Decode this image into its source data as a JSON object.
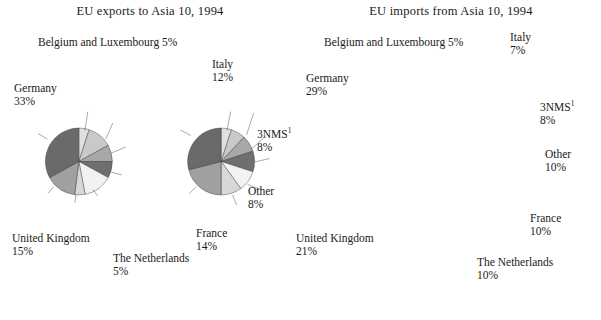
{
  "figure": {
    "title_left": "EU exports to Asia 10, 1994",
    "title_right": "EU imports from Asia 10, 1994",
    "footnote_marker": "1",
    "background": "#ffffff",
    "outline_color": "#2b2b2b"
  },
  "palette": {
    "belgium": "#e0e0e0",
    "italy": "#c9c9c9",
    "nms": "#a8a8a8",
    "other": "#6f6f6f",
    "france": "#f2f2f2",
    "netherlands": "#d8d8d8",
    "uk": "#a0a0a0",
    "germany": "#6a6a6a"
  },
  "chart_data": [
    {
      "type": "pie",
      "id": "eu-exports-asia-10-1994",
      "title": "EU exports to Asia 10, 1994",
      "start_angle_deg": 0,
      "direction": "clockwise",
      "total": 100,
      "unit": "%",
      "categories": [
        "Belgium and Luxembourg",
        "Italy",
        "3NMS",
        "Other",
        "France",
        "The Netherlands",
        "United Kingdom",
        "Germany"
      ],
      "values": [
        5,
        12,
        8,
        8,
        14,
        5,
        15,
        33
      ],
      "labels": [
        {
          "name": "Belgium and Luxembourg",
          "value": 5,
          "text": "Belgium and Luxembourg",
          "pct": "5%",
          "inline": true,
          "superscript": false
        },
        {
          "name": "Italy",
          "value": 12,
          "text": "Italy",
          "pct": "12%",
          "inline": false,
          "superscript": false
        },
        {
          "name": "3NMS",
          "value": 8,
          "text": "3NMS",
          "pct": "8%",
          "inline": false,
          "superscript": true
        },
        {
          "name": "Other",
          "value": 8,
          "text": "Other",
          "pct": "8%",
          "inline": false,
          "superscript": false
        },
        {
          "name": "France",
          "value": 14,
          "text": "France",
          "pct": "14%",
          "inline": false,
          "superscript": false
        },
        {
          "name": "The Netherlands",
          "value": 5,
          "text": "The Netherlands",
          "pct": "5%",
          "inline": false,
          "superscript": false
        },
        {
          "name": "United Kingdom",
          "value": 15,
          "text": "United Kingdom",
          "pct": "15%",
          "inline": false,
          "superscript": false
        },
        {
          "name": "Germany",
          "value": 33,
          "text": "Germany",
          "pct": "33%",
          "inline": false,
          "superscript": false
        }
      ]
    },
    {
      "type": "pie",
      "id": "eu-imports-asia-10-1994",
      "title": "EU imports from Asia 10, 1994",
      "start_angle_deg": 0,
      "direction": "clockwise",
      "total": 100,
      "unit": "%",
      "categories": [
        "Belgium and Luxembourg",
        "Italy",
        "3NMS",
        "Other",
        "France",
        "The Netherlands",
        "United Kingdom",
        "Germany"
      ],
      "values": [
        5,
        7,
        8,
        10,
        10,
        10,
        21,
        29
      ],
      "labels": [
        {
          "name": "Belgium and Luxembourg",
          "value": 5,
          "text": "Belgium and Luxembourg",
          "pct": "5%",
          "inline": true,
          "superscript": false
        },
        {
          "name": "Italy",
          "value": 7,
          "text": "Italy",
          "pct": "7%",
          "inline": false,
          "superscript": false
        },
        {
          "name": "3NMS",
          "value": 8,
          "text": "3NMS",
          "pct": "8%",
          "inline": false,
          "superscript": true
        },
        {
          "name": "Other",
          "value": 10,
          "text": "Other",
          "pct": "10%",
          "inline": false,
          "superscript": false
        },
        {
          "name": "France",
          "value": 10,
          "text": "France",
          "pct": "10%",
          "inline": false,
          "superscript": false
        },
        {
          "name": "The Netherlands",
          "value": 10,
          "text": "The Netherlands",
          "pct": "10%",
          "inline": false,
          "superscript": false
        },
        {
          "name": "United Kingdom",
          "value": 21,
          "text": "United Kingdom",
          "pct": "21%",
          "inline": false,
          "superscript": false
        },
        {
          "name": "Germany",
          "value": 29,
          "text": "Germany",
          "pct": "29%",
          "inline": false,
          "superscript": false
        }
      ]
    }
  ],
  "layout": {
    "left": {
      "cx": 158,
      "cy": 163,
      "r": 67,
      "label_positions": [
        {
          "name": "Belgium and Luxembourg",
          "x": 38,
          "y": 36,
          "align": "left",
          "lx1": 170,
          "ly1": 101,
          "lx2": 176,
          "ly2": 63
        },
        {
          "name": "Italy",
          "x": 212,
          "y": 58,
          "align": "left",
          "lx1": 212,
          "ly1": 118,
          "lx2": 226,
          "ly2": 86
        },
        {
          "name": "3NMS",
          "x": 257,
          "y": 128,
          "align": "left",
          "lx1": 223,
          "ly1": 146,
          "lx2": 252,
          "ly2": 134
        },
        {
          "name": "Other",
          "x": 248,
          "y": 185,
          "align": "left",
          "lx1": 222,
          "ly1": 184,
          "lx2": 244,
          "ly2": 190
        },
        {
          "name": "France",
          "x": 196,
          "y": 227,
          "align": "left",
          "lx1": 186,
          "ly1": 219,
          "lx2": 196,
          "ly2": 232
        },
        {
          "name": "The Netherlands",
          "x": 113,
          "y": 252,
          "align": "left",
          "lx1": 152,
          "ly1": 230,
          "lx2": 150,
          "ly2": 246
        },
        {
          "name": "United Kingdom",
          "x": 12,
          "y": 232,
          "align": "left",
          "lx1": 108,
          "ly1": 213,
          "lx2": 96,
          "ly2": 227
        },
        {
          "name": "Germany",
          "x": 14,
          "y": 82,
          "align": "left",
          "lx1": 95,
          "ly1": 118,
          "lx2": 76,
          "ly2": 107
        }
      ]
    },
    "right": {
      "cx": 443,
      "cy": 163,
      "r": 67,
      "label_positions": [
        {
          "name": "Belgium and Luxembourg",
          "x": 324,
          "y": 36,
          "align": "left",
          "lx1": 455,
          "ly1": 101,
          "lx2": 462,
          "ly2": 63
        },
        {
          "name": "Italy",
          "x": 510,
          "y": 31,
          "align": "left",
          "lx1": 494,
          "ly1": 110,
          "lx2": 508,
          "ly2": 66
        },
        {
          "name": "3NMS",
          "x": 540,
          "y": 101,
          "align": "left",
          "lx1": 503,
          "ly1": 139,
          "lx2": 534,
          "ly2": 110
        },
        {
          "name": "Other",
          "x": 545,
          "y": 148,
          "align": "left",
          "lx1": 510,
          "ly1": 164,
          "lx2": 540,
          "ly2": 157
        },
        {
          "name": "France",
          "x": 530,
          "y": 212,
          "align": "left",
          "lx1": 496,
          "ly1": 209,
          "lx2": 524,
          "ly2": 220
        },
        {
          "name": "The Netherlands",
          "x": 477,
          "y": 256,
          "align": "left",
          "lx1": 466,
          "ly1": 230,
          "lx2": 474,
          "ly2": 250
        },
        {
          "name": "United Kingdom",
          "x": 296,
          "y": 232,
          "align": "left",
          "lx1": 393,
          "ly1": 213,
          "lx2": 380,
          "ly2": 227
        },
        {
          "name": "Germany",
          "x": 306,
          "y": 72,
          "align": "left",
          "lx1": 382,
          "ly1": 111,
          "lx2": 362,
          "ly2": 100
        }
      ]
    }
  }
}
